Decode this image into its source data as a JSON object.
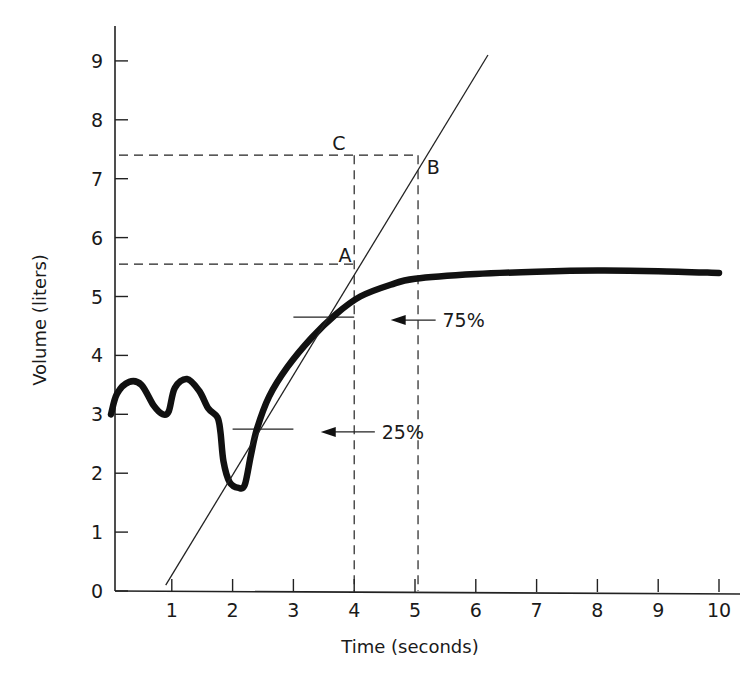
{
  "chart_data": {
    "type": "line",
    "title": "",
    "xlabel": "Time (seconds)",
    "ylabel": "Volume (liters)",
    "xlim": [
      0,
      10.2
    ],
    "ylim": [
      0,
      9.6
    ],
    "x_ticks": [
      "1",
      "2",
      "3",
      "4",
      "5",
      "6",
      "7",
      "8",
      "9",
      "10"
    ],
    "y_ticks": [
      "0",
      "1",
      "2",
      "3",
      "4",
      "5",
      "6",
      "7",
      "8",
      "9"
    ],
    "grid": false,
    "legend": null,
    "series": [
      {
        "name": "Volume curve",
        "style": "thick solid",
        "points": [
          [
            0.0,
            3.0
          ],
          [
            0.1,
            3.35
          ],
          [
            0.3,
            3.55
          ],
          [
            0.5,
            3.5
          ],
          [
            0.7,
            3.15
          ],
          [
            0.85,
            3.0
          ],
          [
            0.95,
            3.05
          ],
          [
            1.05,
            3.45
          ],
          [
            1.25,
            3.6
          ],
          [
            1.45,
            3.4
          ],
          [
            1.6,
            3.1
          ],
          [
            1.75,
            2.95
          ],
          [
            1.8,
            2.7
          ],
          [
            1.85,
            2.2
          ],
          [
            1.95,
            1.85
          ],
          [
            2.1,
            1.75
          ],
          [
            2.2,
            1.8
          ],
          [
            2.3,
            2.3
          ],
          [
            2.4,
            2.75
          ],
          [
            2.6,
            3.3
          ],
          [
            2.9,
            3.8
          ],
          [
            3.3,
            4.3
          ],
          [
            3.7,
            4.7
          ],
          [
            4.1,
            5.0
          ],
          [
            4.6,
            5.2
          ],
          [
            5.0,
            5.3
          ],
          [
            6.0,
            5.38
          ],
          [
            7.0,
            5.42
          ],
          [
            8.0,
            5.44
          ],
          [
            9.0,
            5.43
          ],
          [
            10.0,
            5.4
          ]
        ]
      },
      {
        "name": "Tangent line",
        "style": "thin solid",
        "points": [
          [
            0.9,
            0.1
          ],
          [
            6.2,
            9.1
          ]
        ]
      }
    ],
    "reference_lines": [
      {
        "name": "C-B horizontal dashed",
        "y": 7.4,
        "x_range": [
          0,
          5.05
        ]
      },
      {
        "name": "A horizontal dashed",
        "y": 5.55,
        "x_range": [
          0,
          4.0
        ]
      },
      {
        "name": "vertical dashed at t=4",
        "x": 4.0,
        "y_range": [
          0,
          7.4
        ]
      },
      {
        "name": "vertical dashed at t=5",
        "x": 5.05,
        "y_range": [
          0,
          7.4
        ]
      },
      {
        "name": "75% marker",
        "y": 4.65,
        "x_range": [
          3.0,
          4.0
        ]
      },
      {
        "name": "25% marker",
        "y": 2.75,
        "x_range": [
          2.0,
          3.0
        ]
      }
    ],
    "annotations": [
      {
        "text": "A",
        "x": 3.85,
        "y": 5.7
      },
      {
        "text": "B",
        "x": 5.3,
        "y": 7.2
      },
      {
        "text": "C",
        "x": 3.75,
        "y": 7.6
      },
      {
        "text": "75%",
        "x": 5.8,
        "y": 4.6,
        "arrow_to_x": 4.6
      },
      {
        "text": "25%",
        "x": 4.8,
        "y": 2.7,
        "arrow_to_x": 3.45
      }
    ]
  }
}
